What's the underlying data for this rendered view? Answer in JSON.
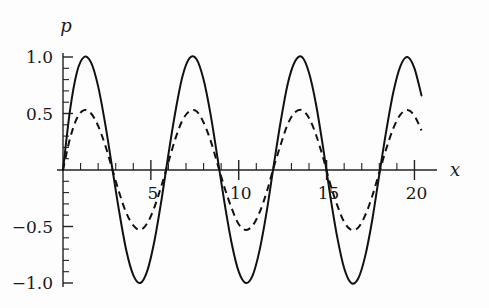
{
  "chart_data": {
    "type": "line",
    "title": "",
    "subtitle": "",
    "xlabel": "x",
    "ylabel": "p",
    "xlim": [
      0,
      20.6
    ],
    "ylim": [
      -1.08,
      1.08
    ],
    "grid": false,
    "legend": null,
    "x_major_ticks": [
      5,
      10,
      15,
      20
    ],
    "x_major_tick_labels": [
      "5",
      "10",
      "15",
      "20"
    ],
    "x_minor_tick_step": 1,
    "y_major_ticks": [
      1.0,
      0.5,
      -0.5,
      -1.0
    ],
    "y_major_tick_labels": [
      "1.0",
      "0.5",
      "−0.5",
      "−1.0"
    ],
    "y_minor_tick_step": 0.1,
    "zero_axis": 0,
    "period": 6.2832,
    "series": [
      {
        "name": "solid-wave",
        "style": "solid",
        "amplitude": 1.0,
        "color": "#111111",
        "x": [
          0.0,
          0.4,
          0.8,
          1.2,
          1.6,
          2.0,
          2.4,
          2.8,
          3.2,
          3.6,
          4.0,
          4.4,
          4.8,
          5.2,
          5.6,
          6.0,
          6.4,
          6.8,
          7.2,
          7.6,
          8.0,
          8.4,
          8.8,
          9.2,
          9.6,
          10.0,
          10.4,
          10.8,
          11.2,
          11.6,
          12.0,
          12.4,
          12.8,
          13.2,
          13.6,
          14.0,
          14.4,
          14.8,
          15.2,
          15.6,
          16.0,
          16.4,
          16.8,
          17.2,
          17.6,
          18.0,
          18.4,
          18.8,
          19.2,
          19.6,
          20.0,
          20.4
        ],
        "y": [
          0.0,
          0.53,
          0.87,
          1.0,
          0.95,
          0.74,
          0.41,
          0.02,
          -0.37,
          -0.71,
          -0.93,
          -1.0,
          -0.89,
          -0.63,
          -0.27,
          0.14,
          0.52,
          0.83,
          0.99,
          0.98,
          0.8,
          0.49,
          0.1,
          -0.3,
          -0.65,
          -0.9,
          -1.0,
          -0.93,
          -0.7,
          -0.36,
          0.05,
          0.44,
          0.77,
          0.96,
          1.0,
          0.86,
          0.58,
          0.2,
          -0.22,
          -0.59,
          -0.87,
          -1.0,
          -0.96,
          -0.76,
          -0.44,
          -0.04,
          0.35,
          0.69,
          0.92,
          1.0,
          0.9,
          0.66
        ]
      },
      {
        "name": "dashed-wave",
        "style": "dashed",
        "amplitude": 0.53,
        "color": "#111111",
        "x": [
          0.0,
          0.4,
          0.8,
          1.2,
          1.6,
          2.0,
          2.4,
          2.8,
          3.2,
          3.6,
          4.0,
          4.4,
          4.8,
          5.2,
          5.6,
          6.0,
          6.4,
          6.8,
          7.2,
          7.6,
          8.0,
          8.4,
          8.8,
          9.2,
          9.6,
          10.0,
          10.4,
          10.8,
          11.2,
          11.6,
          12.0,
          12.4,
          12.8,
          13.2,
          13.6,
          14.0,
          14.4,
          14.8,
          15.2,
          15.6,
          16.0,
          16.4,
          16.8,
          17.2,
          17.6,
          18.0,
          18.4,
          18.8,
          19.2,
          19.6,
          20.0,
          20.4
        ],
        "y": [
          0.0,
          0.28,
          0.46,
          0.53,
          0.5,
          0.39,
          0.22,
          0.01,
          -0.2,
          -0.38,
          -0.49,
          -0.53,
          -0.47,
          -0.33,
          -0.14,
          0.07,
          0.28,
          0.44,
          0.52,
          0.52,
          0.42,
          0.26,
          0.05,
          -0.16,
          -0.34,
          -0.48,
          -0.53,
          -0.49,
          -0.37,
          -0.19,
          0.03,
          0.23,
          0.41,
          0.51,
          0.53,
          0.46,
          0.31,
          0.11,
          -0.12,
          -0.31,
          -0.46,
          -0.53,
          -0.51,
          -0.4,
          -0.23,
          -0.02,
          0.19,
          0.37,
          0.49,
          0.53,
          0.48,
          0.35
        ]
      }
    ]
  },
  "axes": {
    "y_axis_name": "p",
    "x_axis_name": "x"
  }
}
